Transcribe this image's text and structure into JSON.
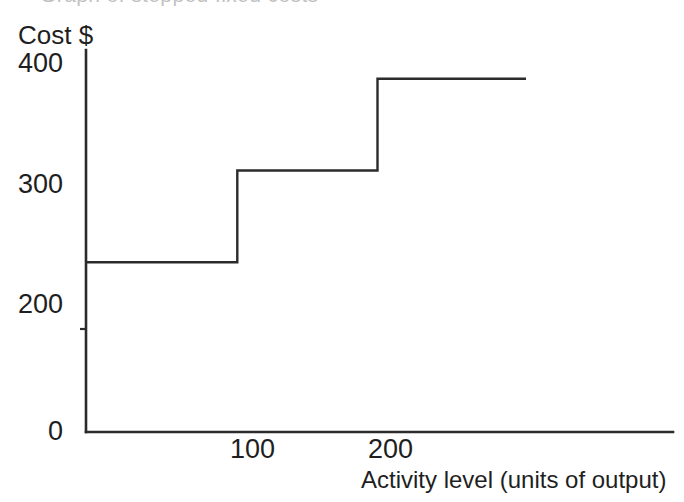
{
  "figure": {
    "clipped_title_ghost": "Graph of stepped fixed costs",
    "background_color": "#ffffff",
    "line_color": "#2b2b2b"
  },
  "axes": {
    "y_axis_title": "Cost $",
    "x_axis_title": "Activity level (units of output)",
    "y_ticks": [
      "400",
      "300",
      "200",
      "0"
    ],
    "x_ticks": [
      "100",
      "200"
    ]
  },
  "chart_data": {
    "type": "line",
    "subtype": "step",
    "title": "",
    "subtitle": "",
    "xlabel": "Activity level (units of output)",
    "ylabel": "Cost $",
    "xlim": [
      0,
      420
    ],
    "ylim": [
      0,
      420
    ],
    "xticks": [
      100,
      200
    ],
    "xticklabels": [
      "100",
      "200"
    ],
    "yticks": [
      0,
      200,
      300,
      400
    ],
    "yticklabels": [
      "0",
      "200",
      "300",
      "400"
    ],
    "grid": false,
    "legend": false,
    "legend_position": "none",
    "series": [
      {
        "name": "Stepped fixed cost",
        "step_mode": "post",
        "x": [
          0,
          109,
          109,
          210,
          210,
          317
        ],
        "y": [
          185,
          185,
          285,
          285,
          385,
          385
        ],
        "steps": [
          {
            "x_start": 0,
            "x_end": 109,
            "cost": 185
          },
          {
            "x_start": 109,
            "x_end": 210,
            "cost": 285
          },
          {
            "x_start": 210,
            "x_end": 317,
            "cost": 385
          }
        ]
      }
    ],
    "annotations": []
  }
}
